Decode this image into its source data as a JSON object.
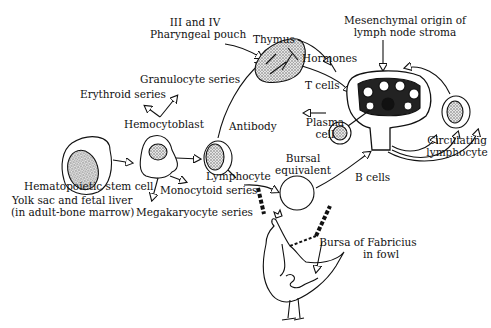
{
  "diagram": {
    "type": "lymphocyte development diagram",
    "labels": {
      "pharyngeal_line1": "III and IV",
      "pharyngeal_line2": "Pharyngeal pouch",
      "thymus": "Thymus",
      "hormones": "Hormones",
      "t_cells": "T cells",
      "mesenchymal_line1": "Mesenchymal origin of",
      "mesenchymal_line2": "lymph node stroma",
      "granulocyte": "Granulocyte series",
      "erythroid": "Erythroid series",
      "hemocytoblast": "Hemocytoblast",
      "antibody": "Antibody",
      "plasma_line1": "Plasma",
      "plasma_line2": "cell",
      "circulating_line1": "Circulating",
      "circulating_line2": "lymphocyte",
      "bursal_line1": "Bursal",
      "bursal_line2": "equivalent",
      "b_cells": "B cells",
      "lymphocyte": "Lymphocyte",
      "hematopoietic": "Hematopoietic stem cell",
      "monocytoid": "Monocytoid series",
      "yolk_line1": "Yolk sac and fetal liver",
      "yolk_line2": "(in adult-bone marrow)",
      "megakaryocyte": "Megakaryocyte series",
      "bursa_line1": "Bursa of Fabricius",
      "bursa_line2": "in fowl"
    },
    "colors": {
      "ink": "#111111",
      "background": "#ffffff",
      "stipple": "#6b6b6b"
    }
  }
}
